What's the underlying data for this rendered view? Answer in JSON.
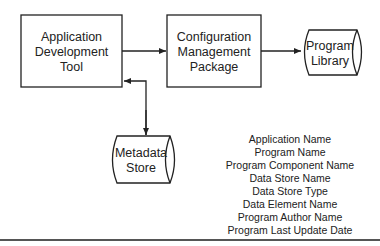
{
  "diagram": {
    "nodes": {
      "app_dev_tool": {
        "lines": [
          "Application",
          "Development",
          "Tool"
        ],
        "shape": "rectangle"
      },
      "config_mgmt": {
        "lines": [
          "Configuration",
          "Management",
          "Package"
        ],
        "shape": "rectangle"
      },
      "program_library": {
        "lines": [
          "Program",
          "Library"
        ],
        "shape": "cylinder-horizontal"
      },
      "metadata_store": {
        "lines": [
          "Metadata",
          "Store"
        ],
        "shape": "cylinder-horizontal"
      }
    },
    "edges": [
      {
        "from": "Application Development Tool",
        "to": "Configuration Management Package",
        "direction": "forward"
      },
      {
        "from": "Configuration Management Package",
        "to": "Program Library",
        "direction": "forward"
      },
      {
        "from": "Application Development Tool",
        "to": "Metadata Store",
        "direction": "bidirectional"
      }
    ],
    "metadata_fields": [
      "Application Name",
      "Program Name",
      "Program Component Name",
      "Data Store Name",
      "Data Store Type",
      "Data Element Name",
      "Program Author Name",
      "Program Last Update Date"
    ],
    "colors": {
      "stroke": "#222222",
      "background": "#ffffff",
      "rule": "#555555"
    }
  }
}
